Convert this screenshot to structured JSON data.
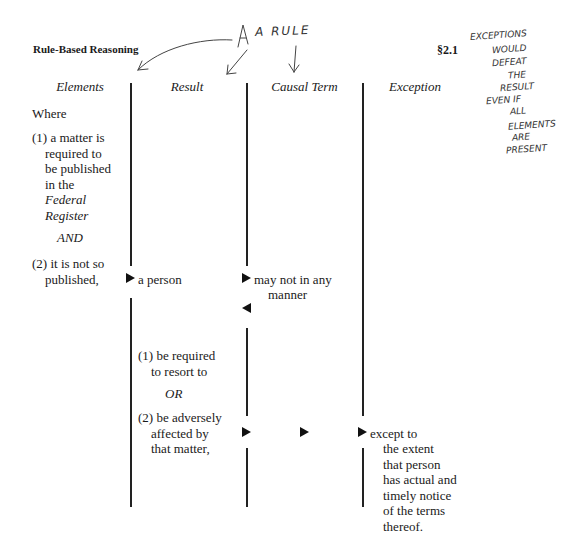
{
  "header": {
    "title": "Rule-Based Reasoning",
    "section": "§2.1"
  },
  "columns": [
    {
      "label": "Elements"
    },
    {
      "label": "Result"
    },
    {
      "label": "Causal Term"
    },
    {
      "label": "Exception"
    }
  ],
  "elements": {
    "intro": "Where",
    "item1": [
      "(1) a matter is",
      "required to",
      "be published",
      "in the"
    ],
    "item1_italic": [
      "Federal",
      "Register"
    ],
    "connector": "AND",
    "item2": [
      "(2) it is not so",
      "published,"
    ]
  },
  "result": {
    "subject": "a person",
    "item1": [
      "(1) be required",
      "to resort to"
    ],
    "connector": "OR",
    "item2": [
      "(2) be adversely",
      "affected by",
      "that matter,"
    ]
  },
  "causal_term": {
    "text": [
      "may not in any",
      "manner"
    ]
  },
  "exception": {
    "text": [
      "except to",
      "the extent",
      "that person",
      "has actual and",
      "timely notice",
      "of the terms",
      "thereof."
    ]
  },
  "annotations": {
    "rule_label": "A RULE",
    "margin_note": [
      "EXCEPTIONS",
      "WOULD",
      "DEFEAT",
      "THE",
      "RESULT",
      "EVEN IF",
      "ALL",
      "ELEMENTS",
      "ARE",
      "PRESENT"
    ]
  }
}
